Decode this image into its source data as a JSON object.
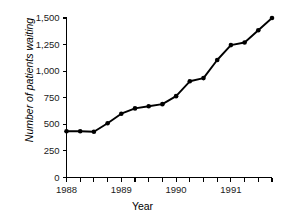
{
  "chart_data": {
    "type": "line",
    "title": "",
    "xlabel": "Year",
    "ylabel": "Number of patients waiting",
    "xlim": [
      1988.0,
      1991.75
    ],
    "ylim": [
      0,
      1500
    ],
    "grid": false,
    "legend": false,
    "marker": "filled-circle",
    "line_color": "#000000",
    "x": [
      1988.0,
      1988.25,
      1988.5,
      1988.75,
      1989.0,
      1989.25,
      1989.5,
      1989.75,
      1990.0,
      1990.25,
      1990.5,
      1990.75,
      1991.0,
      1991.25,
      1991.5,
      1991.75
    ],
    "x_tick_values": [
      1988.0,
      1988.25,
      1988.5,
      1988.75,
      1989.0,
      1989.25,
      1989.5,
      1989.75,
      1990.0,
      1990.25,
      1990.5,
      1990.75,
      1991.0,
      1991.25,
      1991.5,
      1991.75
    ],
    "x_labeled_ticks": [
      {
        "value": 1988.0,
        "label": "1988"
      },
      {
        "value": 1989.0,
        "label": "1989"
      },
      {
        "value": 1990.0,
        "label": "1990"
      },
      {
        "value": 1991.0,
        "label": "1991"
      }
    ],
    "y_ticks": [
      {
        "value": 0,
        "label": "0"
      },
      {
        "value": 250,
        "label": "250"
      },
      {
        "value": 500,
        "label": "500"
      },
      {
        "value": 750,
        "label": "750"
      },
      {
        "value": 1000,
        "label": "1,000"
      },
      {
        "value": 1250,
        "label": "1,250"
      },
      {
        "value": 1500,
        "label": "1,500"
      }
    ],
    "values": [
      435,
      435,
      430,
      510,
      600,
      650,
      670,
      690,
      765,
      905,
      935,
      1105,
      1245,
      1270,
      1385,
      1500
    ],
    "series": [
      {
        "name": "Number of patients waiting",
        "values": [
          435,
          435,
          430,
          510,
          600,
          650,
          670,
          690,
          765,
          905,
          935,
          1105,
          1245,
          1270,
          1385,
          1500
        ]
      }
    ]
  }
}
